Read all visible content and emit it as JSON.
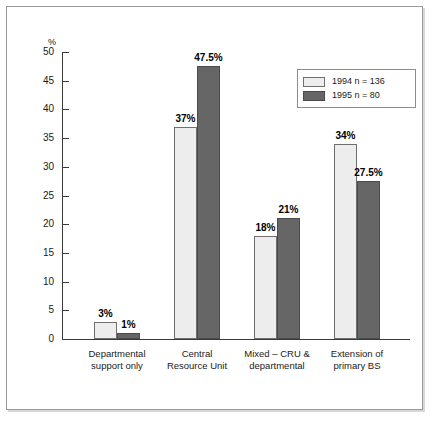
{
  "chart_data": {
    "type": "bar",
    "title": "",
    "subtitle": "",
    "xlabel": "",
    "ylabel": "%",
    "ylim": [
      0,
      50
    ],
    "ytick_step": 5,
    "ytick_labels": [
      "0",
      "5",
      "10",
      "15",
      "20",
      "25",
      "30",
      "35",
      "40",
      "45",
      "50"
    ],
    "grid": false,
    "legend_position": "top-right",
    "categories": [
      "Departmental\nsupport only",
      "Central\nResource Unit",
      "Mixed – CRU &\ndepartmental",
      "Extension of\nprimary BS"
    ],
    "series": [
      {
        "name": "1994 n = 136",
        "color": "#ededed",
        "values": [
          3,
          37,
          18,
          34
        ],
        "value_labels": [
          "3%",
          "37%",
          "18%",
          "34%"
        ]
      },
      {
        "name": "1995 n = 80",
        "color": "#666666",
        "values": [
          1,
          47.5,
          21,
          27.5
        ],
        "value_labels": [
          "1%",
          "47.5%",
          "21%",
          "27.5%"
        ]
      }
    ]
  },
  "legend": {
    "items": [
      {
        "label": "1994 n = 136",
        "swatch": "light-swatch"
      },
      {
        "label": "1995 n = 80",
        "swatch": "dark-swatch"
      }
    ]
  },
  "axis": {
    "unit_label": "%"
  }
}
